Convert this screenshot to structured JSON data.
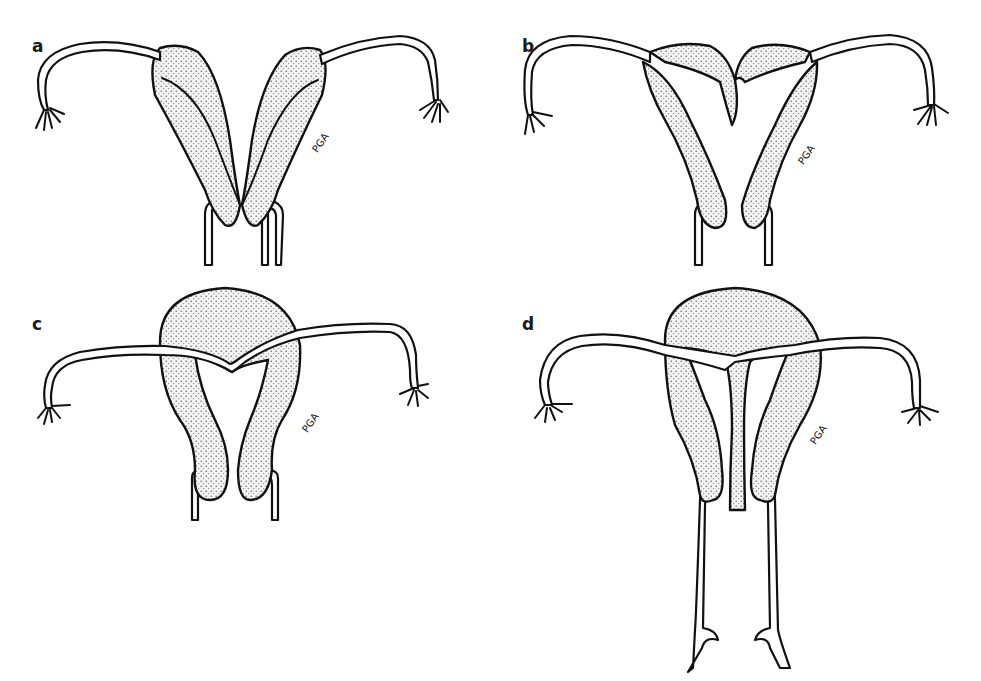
{
  "figure": {
    "panels": [
      {
        "id": "a",
        "label": "a",
        "signature": "PGA",
        "description": "Two completely separate uterine horns, each with own cervix"
      },
      {
        "id": "b",
        "label": "b",
        "signature": "PGA",
        "description": "Separate horns joined at fundus with V-shaped fundal notch, two cervices"
      },
      {
        "id": "c",
        "label": "c",
        "signature": "PGA",
        "description": "Single rounded fundus with deep septum/notch, two lower segments"
      },
      {
        "id": "d",
        "label": "d",
        "signature": "PGA",
        "description": "Single fundus with complete septum extending to cervix, with vagina"
      }
    ],
    "colors": {
      "stroke": "#111111",
      "stipple": "#e8e8e8",
      "background": "#ffffff"
    }
  }
}
